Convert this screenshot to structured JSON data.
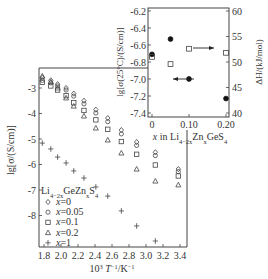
{
  "chart_data": [
    {
      "type": "scatter",
      "name": "main",
      "title": "",
      "xlabel": "10³ T⁻¹/K⁻¹",
      "ylabel": "lg[σ/(S/cm)]",
      "xlim": [
        1.72,
        3.48
      ],
      "ylim": [
        -9.25,
        -2.2
      ],
      "xticks": [
        1.8,
        2.0,
        2.2,
        2.4,
        2.6,
        2.8,
        3.0,
        3.2,
        3.4
      ],
      "xtick_labels": [
        "1.8",
        "2.0",
        "2.2",
        "2.4",
        "2.6",
        "2.8",
        "3.0",
        "3.2",
        "3.4"
      ],
      "yticks": [
        -3,
        -4,
        -5,
        -6,
        -7,
        -8
      ],
      "ytick_labels": [
        "-3",
        "-4",
        "-5",
        "-6",
        "-7",
        "-8"
      ],
      "legend": {
        "title": "Li4-2xGeZnxS4",
        "position": "lower-left",
        "entries": [
          "x=0",
          "x=0.05",
          "x=0.1",
          "x=0.2",
          "x=1"
        ]
      },
      "series": [
        {
          "name": "x=0",
          "marker": "diamond",
          "x": [
            1.78,
            1.88,
            1.96,
            2.06,
            2.15,
            2.27,
            2.41,
            2.55,
            2.71,
            2.89,
            3.11,
            3.38
          ],
          "y": [
            -2.6,
            -2.7,
            -2.85,
            -3.0,
            -3.22,
            -3.5,
            -3.85,
            -4.18,
            -4.65,
            -5.12,
            -5.52,
            -6.18
          ]
        },
        {
          "name": "x=0.05",
          "marker": "circle",
          "x": [
            1.78,
            1.88,
            1.96,
            2.06,
            2.15,
            2.27,
            2.41,
            2.55,
            2.71,
            2.89,
            3.11,
            3.38
          ],
          "y": [
            -2.7,
            -2.8,
            -2.92,
            -3.08,
            -3.32,
            -3.62,
            -3.98,
            -4.32,
            -4.8,
            -5.25,
            -5.65,
            -6.28
          ]
        },
        {
          "name": "x=0.1",
          "marker": "square",
          "x": [
            1.78,
            1.88,
            1.96,
            2.06,
            2.15,
            2.27,
            2.41,
            2.55,
            2.71,
            2.89,
            3.11,
            3.38
          ],
          "y": [
            -2.78,
            -2.92,
            -3.08,
            -3.3,
            -3.58,
            -3.88,
            -4.25,
            -4.62,
            -5.1,
            -5.6,
            -6.02,
            -6.45
          ]
        },
        {
          "name": "x=0.2",
          "marker": "triangle",
          "x": [
            1.78,
            1.88,
            1.96,
            2.06,
            2.15,
            2.27,
            2.41,
            2.55,
            2.71,
            2.89,
            3.11,
            3.38
          ],
          "y": [
            -2.53,
            -2.76,
            -3.0,
            -3.39,
            -3.71,
            -4.1,
            -4.57,
            -5.04,
            -5.55,
            -6.18,
            -6.65,
            -6.8
          ]
        },
        {
          "name": "x=1",
          "marker": "plus",
          "x": [
            1.78,
            1.88,
            1.96,
            2.06,
            2.15,
            2.27,
            2.41,
            2.55,
            2.71,
            2.89,
            3.11
          ],
          "y": [
            -5.16,
            -5.39,
            -5.71,
            -5.94,
            -6.25,
            -6.53,
            -6.88,
            -7.24,
            -7.82,
            -8.41,
            -9.0
          ]
        }
      ]
    },
    {
      "type": "scatter",
      "name": "inset",
      "title": "",
      "xlabel": "x in Li4-2xZnxGeS4",
      "ylabel_left": "lg[σ(25°C)/(S/cm)]",
      "ylabel_right": "ΔH/(kJ/mol)",
      "xlim": [
        -0.01,
        0.21
      ],
      "ylim_left": [
        -7.55,
        -6.15
      ],
      "ylim_right": [
        39.5,
        60.5
      ],
      "xticks": [
        0,
        0.1,
        0.2
      ],
      "xtick_labels": [
        "0",
        "0.10",
        "0.20"
      ],
      "yticks_left": [
        -6.2,
        -6.4,
        -6.6,
        -6.8,
        -7.0,
        -7.2,
        -7.4
      ],
      "ytick_labels_left": [
        "-6.2",
        "-6.4",
        "-6.6",
        "-6.8",
        "-7.0",
        "-7.2",
        "-7.4"
      ],
      "yticks_right": [
        60,
        55,
        50,
        45,
        40
      ],
      "ytick_labels_right": [
        "60",
        "55",
        "50",
        "45",
        "40"
      ],
      "series": [
        {
          "name": "lg σ(25°C)",
          "marker": "filled-circle",
          "axis": "left",
          "x": [
            0,
            0.05,
            0.1,
            0.2
          ],
          "y": [
            -6.71,
            -6.53,
            -7.0,
            -7.23
          ]
        },
        {
          "name": "ΔH",
          "marker": "open-square",
          "axis": "right",
          "x": [
            0,
            0.05,
            0.1,
            0.2
          ],
          "y": [
            51.0,
            49.6,
            52.6,
            51.8
          ]
        }
      ],
      "annotations": [
        {
          "type": "arrow",
          "direction": "left",
          "target": "left-axis"
        },
        {
          "type": "arrow",
          "direction": "right",
          "target": "right-axis"
        }
      ]
    }
  ],
  "labels": {
    "main_xlabel_pre": "10",
    "main_xlabel_sup": "3",
    "main_xlabel_T": " T",
    "main_xlabel_sup2": "−1",
    "main_xlabel_post": "/K",
    "main_xlabel_sup3": "−1",
    "main_ylabel": "lg[σ/(S/cm)]",
    "legend_title_pre": "Li",
    "legend_title_sub": "4−2x",
    "legend_title_mid": "GeZn",
    "legend_title_sub2": "x",
    "legend_title_post": "S",
    "legend_title_sub3": "4",
    "inset_xlabel_pre": "x in Li",
    "inset_xlabel_sub": "4−2x",
    "inset_xlabel_mid": "Zn",
    "inset_xlabel_sub2": "x",
    "inset_xlabel_post": "GeS",
    "inset_xlabel_sub3": "4",
    "inset_ylabel_left": "lg[σ(25°C)/(S/cm)]",
    "inset_ylabel_right": "ΔH/(kJ/mol)"
  }
}
